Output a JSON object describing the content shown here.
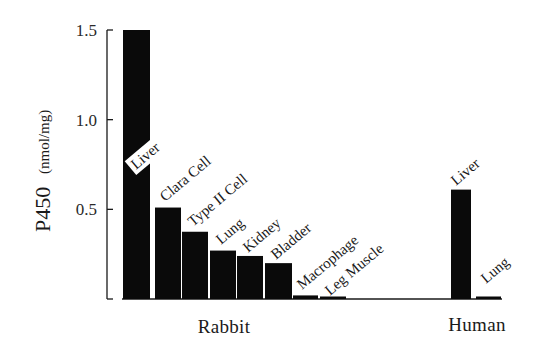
{
  "chart_data": {
    "type": "bar",
    "title": "",
    "xlabel": "",
    "ylabel": "P450",
    "ylabel_unit": "(nmol/mg)",
    "ylim": [
      0,
      1.5
    ],
    "yticks": [
      {
        "value": 0.5,
        "label": "0.5"
      },
      {
        "value": 1.0,
        "label": "1.0"
      },
      {
        "value": 1.5,
        "label": "1.5"
      }
    ],
    "grid": false,
    "legend": null,
    "groups": [
      {
        "name": "Rabbit",
        "bars": [
          {
            "label": "Liver",
            "value": 1.5,
            "note": "bar extends to top of axis"
          },
          {
            "label": "Clara Cell",
            "value": 0.51
          },
          {
            "label": "Type II Cell",
            "value": 0.375
          },
          {
            "label": "Lung",
            "value": 0.27
          },
          {
            "label": "Kidney",
            "value": 0.24
          },
          {
            "label": "Bladder",
            "value": 0.2
          },
          {
            "label": "Macrophage",
            "value": 0.02
          },
          {
            "label": "Leg Muscle",
            "value": 0.01
          }
        ]
      },
      {
        "name": "Human",
        "bars": [
          {
            "label": "Liver",
            "value": 0.61
          },
          {
            "label": "Lung",
            "value": 0.01
          }
        ]
      }
    ],
    "bar_color": "#0a0a0a"
  }
}
